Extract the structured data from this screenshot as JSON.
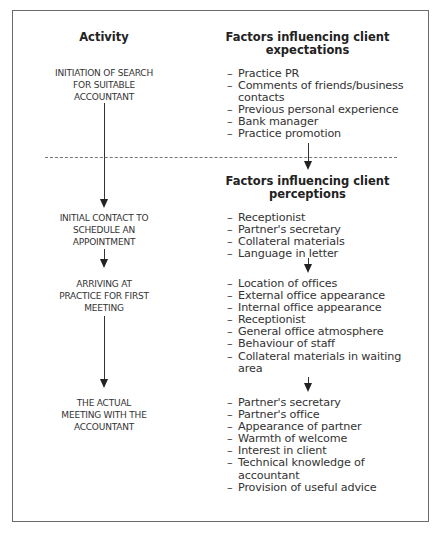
{
  "headers": {
    "activity": "Activity",
    "expectations_line1": "Factors influencing client",
    "expectations_line2": "expectations",
    "perceptions_line1": "Factors influencing client",
    "perceptions_line2": "perceptions"
  },
  "activities": [
    {
      "lines": [
        "INITIATION OF SEARCH",
        "FOR SUITABLE",
        "ACCOUNTANT"
      ]
    },
    {
      "lines": [
        "INITIAL CONTACT TO",
        "SCHEDULE AN",
        "APPOINTMENT"
      ]
    },
    {
      "lines": [
        "ARRIVING AT",
        "PRACTICE FOR FIRST",
        "MEETING"
      ]
    },
    {
      "lines": [
        "THE ACTUAL",
        "MEETING WITH THE",
        "ACCOUNTANT"
      ]
    }
  ],
  "expectation_factors": [
    "Practice PR",
    "Comments of friends/business contacts",
    "Previous personal experience",
    "Bank manager",
    "Practice promotion"
  ],
  "perception_groups": [
    [
      "Receptionist",
      "Partner's secretary",
      "Collateral materials",
      "Language in letter"
    ],
    [
      "Location of offices",
      "External office appearance",
      "Internal office appearance",
      "Receptionist",
      "General office atmosphere",
      "Behaviour of staff",
      "Collateral materials in waiting area"
    ],
    [
      "Partner's secretary",
      "Partner's office",
      "Appearance of partner",
      "Warmth of welcome",
      "Interest in client",
      "Technical knowledge of accountant",
      "Provision of useful advice"
    ]
  ],
  "dash": "–"
}
